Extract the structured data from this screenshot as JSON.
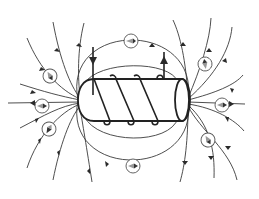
{
  "diagram": {
    "elements": {
      "solenoid": {
        "label": "solenoid coil with core",
        "turns": 3
      },
      "current_leads": [
        {
          "name": "input-lead",
          "direction": "down",
          "x": 93
        },
        {
          "name": "output-lead",
          "direction": "up",
          "x": 164
        }
      ],
      "field_lines": {
        "count_left_fan": 7,
        "count_right_fan": 7,
        "loops_around": 2
      },
      "compass_needles": [
        {
          "id": "top",
          "cx": 131,
          "cy": 41
        },
        {
          "id": "bottom",
          "cx": 133,
          "cy": 166
        },
        {
          "id": "left-upper",
          "cx": 50,
          "cy": 76
        },
        {
          "id": "left-middle",
          "cx": 42,
          "cy": 106
        },
        {
          "id": "left-lower",
          "cx": 49,
          "cy": 129
        },
        {
          "id": "right-upper",
          "cx": 205,
          "cy": 64
        },
        {
          "id": "right-middle",
          "cx": 222,
          "cy": 105
        },
        {
          "id": "right-lower",
          "cx": 208,
          "cy": 140
        }
      ]
    },
    "colors": {
      "line": "#3a3a3a",
      "body": "#222222",
      "background": "#ffffff",
      "needle": "#888888"
    }
  }
}
